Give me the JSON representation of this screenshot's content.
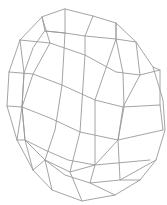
{
  "figure": {
    "background": "#ffffff",
    "stroke": "#9a9a9a",
    "stroke_width": 0.9
  },
  "mesh": {
    "outline": [
      [
        65,
        9
      ],
      [
        93,
        16
      ],
      [
        116,
        23
      ],
      [
        136,
        42
      ],
      [
        153,
        67
      ],
      [
        163,
        100
      ],
      [
        165,
        130
      ],
      [
        156,
        160
      ],
      [
        140,
        180
      ],
      [
        115,
        195
      ],
      [
        82,
        201
      ],
      [
        52,
        190
      ],
      [
        33,
        170
      ],
      [
        17,
        140
      ],
      [
        7,
        106
      ],
      [
        9,
        72
      ],
      [
        20,
        40
      ],
      [
        42,
        17
      ]
    ],
    "inner_rim": [
      [
        45,
        31
      ],
      [
        65,
        33
      ],
      [
        85,
        36
      ],
      [
        116,
        39
      ],
      [
        123,
        73
      ],
      [
        124,
        107
      ],
      [
        118,
        140
      ],
      [
        95,
        165
      ],
      [
        70,
        172
      ],
      [
        45,
        160
      ],
      [
        25,
        140
      ],
      [
        22,
        107
      ],
      [
        24,
        73
      ],
      [
        33,
        48
      ]
    ],
    "rows": [
      [
        [
          20,
          40
        ],
        [
          50,
          43
        ],
        [
          85,
          55
        ],
        [
          116,
          72
        ],
        [
          140,
          75
        ],
        [
          160,
          70
        ]
      ],
      [
        [
          9,
          72
        ],
        [
          33,
          74
        ],
        [
          62,
          85
        ],
        [
          95,
          100
        ],
        [
          123,
          107
        ],
        [
          160,
          105
        ]
      ],
      [
        [
          7,
          106
        ],
        [
          22,
          107
        ],
        [
          50,
          118
        ],
        [
          80,
          132
        ],
        [
          118,
          140
        ],
        [
          163,
          130
        ]
      ],
      [
        [
          17,
          140
        ],
        [
          25,
          140
        ],
        [
          45,
          150
        ],
        [
          68,
          160
        ],
        [
          95,
          165
        ],
        [
          150,
          160
        ]
      ],
      [
        [
          33,
          170
        ],
        [
          45,
          160
        ],
        [
          65,
          175
        ],
        [
          90,
          183
        ],
        [
          120,
          180
        ],
        [
          156,
          160
        ]
      ],
      [
        [
          42,
          17
        ],
        [
          45,
          31
        ],
        [
          65,
          33
        ]
      ],
      [
        [
          116,
          23
        ],
        [
          116,
          39
        ],
        [
          136,
          42
        ]
      ]
    ],
    "cols": [
      [
        [
          65,
          9
        ],
        [
          65,
          33
        ],
        [
          62,
          85
        ],
        [
          55,
          130
        ],
        [
          45,
          160
        ],
        [
          52,
          190
        ]
      ],
      [
        [
          93,
          16
        ],
        [
          85,
          36
        ],
        [
          85,
          55
        ],
        [
          80,
          132
        ],
        [
          70,
          172
        ],
        [
          82,
          201
        ]
      ],
      [
        [
          116,
          23
        ],
        [
          116,
          39
        ],
        [
          95,
          100
        ],
        [
          95,
          165
        ],
        [
          90,
          183
        ],
        [
          115,
          195
        ]
      ],
      [
        [
          136,
          42
        ],
        [
          140,
          75
        ],
        [
          123,
          107
        ],
        [
          118,
          140
        ],
        [
          120,
          180
        ],
        [
          140,
          180
        ]
      ],
      [
        [
          42,
          17
        ],
        [
          50,
          43
        ],
        [
          33,
          74
        ],
        [
          22,
          107
        ],
        [
          25,
          140
        ],
        [
          33,
          170
        ]
      ],
      [
        [
          153,
          67
        ],
        [
          160,
          70
        ],
        [
          160,
          105
        ],
        [
          163,
          130
        ]
      ],
      [
        [
          20,
          40
        ],
        [
          24,
          73
        ],
        [
          22,
          107
        ],
        [
          17,
          140
        ]
      ]
    ]
  }
}
